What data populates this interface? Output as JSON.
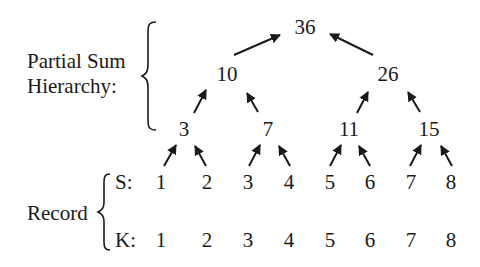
{
  "labels": {
    "hierarchy_line1": "Partial Sum",
    "hierarchy_line2": "Hierarchy:",
    "record": "Record",
    "s_row": "S:",
    "k_row": "K:"
  },
  "tree": {
    "root": "36",
    "level1": [
      "10",
      "26"
    ],
    "level2": [
      "3",
      "7",
      "11",
      "15"
    ]
  },
  "record": {
    "S": [
      "1",
      "2",
      "3",
      "4",
      "5",
      "6",
      "7",
      "8"
    ],
    "K": [
      "1",
      "2",
      "3",
      "4",
      "5",
      "6",
      "7",
      "8"
    ]
  }
}
